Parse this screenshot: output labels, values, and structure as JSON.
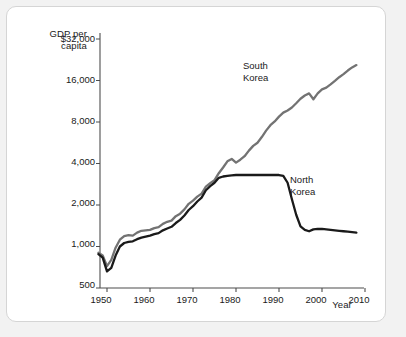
{
  "chart_data": {
    "type": "line",
    "title": "",
    "ylabel": "GDP per\ncapita",
    "xlabel": "Year",
    "yscale": "log2",
    "ylim": [
      500,
      32000
    ],
    "xlim": [
      1948,
      2011
    ],
    "grid": false,
    "legend_position": "inline-annotations",
    "ytick_labels": [
      "$32,000",
      "16,000",
      "8,000",
      "4,000",
      "2,000",
      "1,000",
      "500"
    ],
    "ytick_values": [
      32000,
      16000,
      8000,
      4000,
      2000,
      1000,
      500
    ],
    "xtick_labels": [
      "1950",
      "1960",
      "1970",
      "1980",
      "1990",
      "2000",
      "2010"
    ],
    "xtick_values": [
      1950,
      1960,
      1970,
      1980,
      1990,
      2000,
      2010
    ],
    "colors": {
      "south_korea": "#737373",
      "north_korea": "#1a1a1a",
      "axis": "#4d4d4d",
      "card_border": "#d5d5d5",
      "page_background": "#f2f2f2"
    },
    "series": [
      {
        "name": "South Korea",
        "color": "#737373",
        "label_text": "South\nKorea",
        "x": [
          1948,
          1949,
          1950,
          1951,
          1952,
          1953,
          1954,
          1955,
          1956,
          1957,
          1958,
          1959,
          1960,
          1961,
          1962,
          1963,
          1964,
          1965,
          1966,
          1967,
          1968,
          1969,
          1970,
          1971,
          1972,
          1973,
          1974,
          1975,
          1976,
          1977,
          1978,
          1979,
          1980,
          1981,
          1982,
          1983,
          1984,
          1985,
          1986,
          1987,
          1988,
          1989,
          1990,
          1991,
          1992,
          1993,
          1994,
          1995,
          1996,
          1997,
          1998,
          1999,
          2000,
          2001,
          2002,
          2003,
          2004,
          2005,
          2006,
          2007,
          2008
        ],
        "values": [
          900,
          860,
          720,
          800,
          980,
          1120,
          1190,
          1210,
          1200,
          1260,
          1300,
          1310,
          1320,
          1360,
          1380,
          1460,
          1510,
          1540,
          1660,
          1730,
          1860,
          2040,
          2150,
          2300,
          2420,
          2720,
          2880,
          3030,
          3400,
          3740,
          4150,
          4320,
          4060,
          4260,
          4520,
          4960,
          5370,
          5660,
          6220,
          6930,
          7580,
          8080,
          8750,
          9360,
          9700,
          10200,
          10950,
          11800,
          12450,
          12900,
          11700,
          12900,
          13800,
          14200,
          15000,
          15900,
          16900,
          17800,
          18900,
          19900,
          20700
        ]
      },
      {
        "name": "North Korea",
        "color": "#1a1a1a",
        "label_text": "North\nKorea",
        "x": [
          1948,
          1949,
          1950,
          1951,
          1952,
          1953,
          1954,
          1955,
          1956,
          1957,
          1958,
          1959,
          1960,
          1961,
          1962,
          1963,
          1964,
          1965,
          1966,
          1967,
          1968,
          1969,
          1970,
          1971,
          1972,
          1973,
          1974,
          1975,
          1976,
          1977,
          1978,
          1979,
          1980,
          1981,
          1982,
          1983,
          1984,
          1985,
          1986,
          1987,
          1988,
          1989,
          1990,
          1991,
          1992,
          1993,
          1994,
          1995,
          1996,
          1997,
          1998,
          1999,
          2000,
          2001,
          2002,
          2003,
          2004,
          2005,
          2006,
          2007,
          2008
        ],
        "values": [
          880,
          830,
          660,
          700,
          860,
          1000,
          1060,
          1080,
          1090,
          1130,
          1160,
          1180,
          1200,
          1230,
          1250,
          1310,
          1350,
          1390,
          1480,
          1560,
          1680,
          1840,
          1960,
          2120,
          2260,
          2560,
          2740,
          2900,
          3150,
          3220,
          3250,
          3280,
          3300,
          3300,
          3300,
          3300,
          3300,
          3300,
          3300,
          3300,
          3300,
          3300,
          3300,
          3250,
          2900,
          2200,
          1700,
          1400,
          1320,
          1290,
          1330,
          1340,
          1340,
          1330,
          1320,
          1310,
          1300,
          1290,
          1280,
          1270,
          1260
        ]
      }
    ]
  }
}
